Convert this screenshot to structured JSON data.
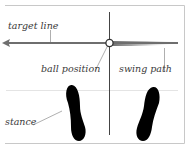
{
  "diagram": {
    "labels": {
      "target_line": "target line",
      "ball_position": "ball position",
      "swing_path": "swing path",
      "stance": "stance"
    },
    "colors": {
      "frame": "#c8c8c8",
      "target_line": "#6e6e6e",
      "swing_path": "#8a8a8a",
      "vertical_line": "#444444",
      "leader": "#9a9a9a",
      "footprint": "#000000",
      "ball_fill": "#ffffff",
      "ball_stroke": "#333333"
    },
    "icons": {
      "left_foot": "footprint-icon",
      "right_foot": "footprint-icon",
      "ball": "golf-ball-icon",
      "arrow": "arrow-left-icon"
    }
  }
}
